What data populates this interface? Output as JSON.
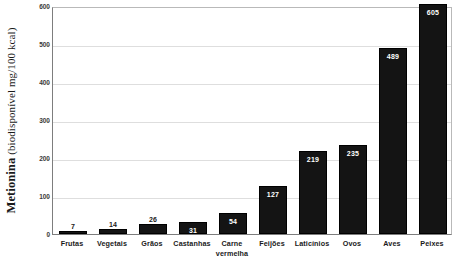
{
  "chart_data": {
    "type": "bar",
    "title": "",
    "subtitle": "",
    "xlabel": "",
    "ylabel": "Metionina (biodisponível mg/100 kcal)",
    "ylabel_parts": {
      "strong": "Metionina",
      "sub": " (biodisponível mg/100 kcal)"
    },
    "categories": [
      "Frutas",
      "Vegetais",
      "Grãos",
      "Castanhas",
      "Carne\nvermelha",
      "Feijões",
      "Laticínios",
      "Ovos",
      "Aves",
      "Peixes"
    ],
    "values": [
      7,
      14,
      26,
      31,
      54,
      127,
      219,
      235,
      489,
      605
    ],
    "value_labels": [
      "7",
      "14",
      "26",
      "31",
      "54",
      "127",
      "219",
      "235",
      "489",
      "605"
    ],
    "value_label_placement": [
      "outside",
      "outside",
      "outside",
      "inside",
      "inside",
      "inside",
      "inside",
      "inside",
      "inside",
      "inside"
    ],
    "ylim": [
      0,
      600
    ],
    "yticks": [
      0,
      100,
      200,
      300,
      400,
      500,
      600
    ],
    "ytick_labels": [
      "0",
      "100",
      "200",
      "300",
      "400",
      "500",
      "600"
    ],
    "grid": true,
    "legend": false,
    "legend_position": "none",
    "bar_color": "#141414",
    "grid_color": "#dedede",
    "axis_color": "#7d7d7d",
    "label_color_outside": "#1a1a1a",
    "label_color_inside": "#ffffff"
  }
}
